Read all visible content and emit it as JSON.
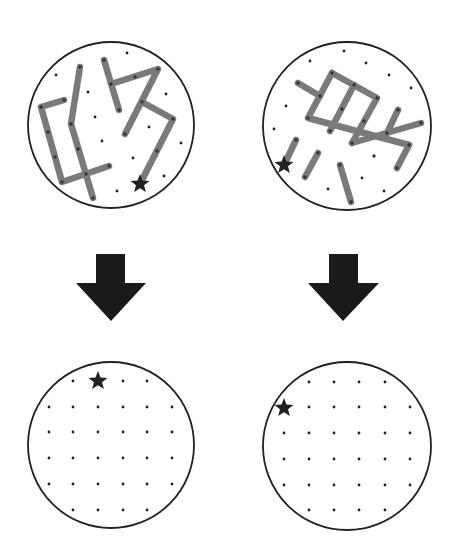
{
  "colors": {
    "background": "#ffffff",
    "circle_stroke": "#222222",
    "stick": "#7a7a7a",
    "dot": "#222222",
    "star": "#222222",
    "arrow": "#1a1a1a"
  },
  "panels": [
    {
      "id": "top-left",
      "label": "stick-figure-1",
      "circle": {
        "cx": 111,
        "cy": 125,
        "r": 83
      },
      "sticks": [
        [
          [
            64,
            100
          ],
          [
            41,
            107
          ],
          [
            62,
            182
          ],
          [
            109,
            166
          ]
        ],
        [
          [
            80,
            67
          ],
          [
            71,
            124
          ],
          [
            93,
            198
          ]
        ],
        [
          [
            104,
            60
          ],
          [
            119,
            110
          ]
        ],
        [
          [
            111,
            84
          ],
          [
            158,
            69
          ],
          [
            125,
            134
          ]
        ],
        [
          [
            142,
            102
          ],
          [
            173,
            119
          ],
          [
            140,
            184
          ]
        ]
      ],
      "stick_dots": [
        [
          64,
          100
        ],
        [
          41,
          107
        ],
        [
          48,
          132
        ],
        [
          55,
          157
        ],
        [
          62,
          182
        ],
        [
          86,
          174
        ],
        [
          109,
          166
        ],
        [
          80,
          67
        ],
        [
          71,
          124
        ],
        [
          78,
          149
        ],
        [
          93,
          198
        ],
        [
          104,
          60
        ],
        [
          111,
          84
        ],
        [
          119,
          110
        ],
        [
          135,
          77
        ],
        [
          158,
          69
        ],
        [
          142,
          102
        ],
        [
          125,
          134
        ],
        [
          173,
          119
        ],
        [
          157,
          151
        ]
      ],
      "dots": [
        [
          127,
          53
        ],
        [
          56,
          75
        ],
        [
          88,
          92
        ],
        [
          166,
          94
        ],
        [
          95,
          117
        ],
        [
          149,
          127
        ],
        [
          102,
          141
        ],
        [
          181,
          143
        ],
        [
          133,
          158
        ],
        [
          164,
          176
        ],
        [
          117,
          191
        ]
      ],
      "star": {
        "x": 140,
        "y": 184,
        "r": 10
      }
    },
    {
      "id": "top-right",
      "label": "stick-figure-2",
      "circle": {
        "cx": 347,
        "cy": 126,
        "r": 84
      },
      "sticks": [
        [
          [
            298,
            83
          ],
          [
            320,
            96
          ]
        ],
        [
          [
            332,
            73
          ],
          [
            377,
            98
          ],
          [
            352,
            143
          ]
        ],
        [
          [
            332,
            73
          ],
          [
            308,
            118
          ],
          [
            409,
            145
          ]
        ],
        [
          [
            354,
            85
          ],
          [
            330,
            131
          ]
        ],
        [
          [
            352,
            143
          ],
          [
            421,
            123
          ]
        ],
        [
          [
            398,
            110
          ],
          [
            387,
            133
          ]
        ],
        [
          [
            409,
            145
          ],
          [
            397,
            168
          ]
        ],
        [
          [
            296,
            140
          ],
          [
            284,
            165
          ]
        ],
        [
          [
            318,
            153
          ],
          [
            305,
            177
          ]
        ],
        [
          [
            340,
            165
          ],
          [
            351,
            202
          ]
        ]
      ],
      "stick_dots": [
        [
          298,
          83
        ],
        [
          320,
          96
        ],
        [
          332,
          73
        ],
        [
          354,
          85
        ],
        [
          377,
          98
        ],
        [
          308,
          118
        ],
        [
          342,
          109
        ],
        [
          330,
          131
        ],
        [
          364,
          121
        ],
        [
          352,
          143
        ],
        [
          398,
          110
        ],
        [
          387,
          133
        ],
        [
          421,
          123
        ],
        [
          374,
          156
        ],
        [
          397,
          168
        ],
        [
          409,
          145
        ],
        [
          296,
          140
        ],
        [
          318,
          153
        ],
        [
          305,
          177
        ],
        [
          340,
          165
        ],
        [
          351,
          202
        ]
      ],
      "dots": [
        [
          344,
          51
        ],
        [
          310,
          61
        ],
        [
          366,
          63
        ],
        [
          389,
          75
        ],
        [
          411,
          88
        ],
        [
          286,
          106
        ],
        [
          274,
          129
        ],
        [
          362,
          178
        ],
        [
          328,
          189
        ],
        [
          384,
          191
        ]
      ],
      "star": {
        "x": 284,
        "y": 165,
        "r": 10
      }
    },
    {
      "id": "bottom-left",
      "label": "empty-grid-1",
      "circle": {
        "cx": 111,
        "cy": 445,
        "r": 83
      },
      "grid": {
        "xs": [
          49,
          73,
          98,
          123,
          147,
          172
        ],
        "ys": [
          381,
          407,
          432,
          458,
          484,
          510
        ],
        "skip_corners": true
      },
      "star": {
        "x": 98,
        "y": 381,
        "r": 10
      }
    },
    {
      "id": "bottom-right",
      "label": "empty-grid-2",
      "circle": {
        "cx": 347,
        "cy": 446,
        "r": 84
      },
      "grid": {
        "xs": [
          284,
          309,
          334,
          359,
          385,
          410
        ],
        "ys": [
          382,
          407,
          433,
          459,
          485,
          510
        ],
        "skip_corners": true
      },
      "star": {
        "x": 284,
        "y": 408,
        "r": 10
      }
    }
  ],
  "arrows": [
    {
      "id": "arrow-left",
      "stem": {
        "x1": 96,
        "x2": 125,
        "y1": 254,
        "y2": 283
      },
      "head": {
        "x1": 76,
        "x2": 146,
        "tip_x": 111,
        "tip_y": 321
      }
    },
    {
      "id": "arrow-right",
      "stem": {
        "x1": 329,
        "x2": 358,
        "y1": 254,
        "y2": 283
      },
      "head": {
        "x1": 308,
        "x2": 379,
        "tip_x": 343,
        "tip_y": 321
      }
    }
  ]
}
